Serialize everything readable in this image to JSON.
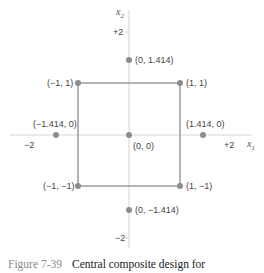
{
  "figure": {
    "caption_number": "Figure 7-39",
    "caption_text": "Central composite design for"
  },
  "axes": {
    "x_label": "x",
    "x_sub": "1",
    "y_label": "x",
    "y_sub": "2",
    "x_ticks": [
      "−2",
      "+2"
    ],
    "y_ticks": [
      "+2",
      "−2"
    ]
  },
  "points": [
    {
      "label": "(0, 1.414)"
    },
    {
      "label": "(−1, 1)"
    },
    {
      "label": "(1, 1)"
    },
    {
      "label": "(−1.414, 0)"
    },
    {
      "label": "(1.414, 0)"
    },
    {
      "label": "(0, 0)"
    },
    {
      "label": "(−1, −1)"
    },
    {
      "label": "(1, −1)"
    },
    {
      "label": "(0, −1.414)"
    }
  ],
  "colors": {
    "point": "#8c8c8c",
    "square": "#999999",
    "axis": "#d0d0d0"
  }
}
